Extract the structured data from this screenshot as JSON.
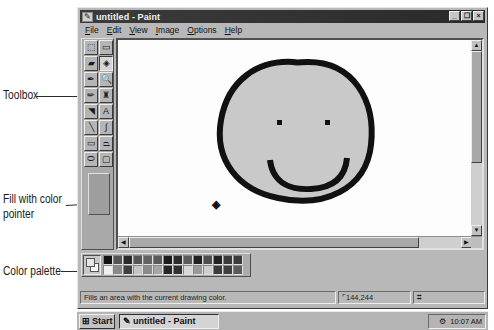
{
  "window": {
    "title": "untitled - Paint",
    "title_icon": "paint-icon",
    "controls": [
      {
        "name": "minimize",
        "glyph": "_"
      },
      {
        "name": "maximize",
        "glyph": "❐"
      },
      {
        "name": "close",
        "glyph": "×"
      }
    ]
  },
  "menu": [
    {
      "key": "F",
      "rest": "ile"
    },
    {
      "key": "E",
      "rest": "dit"
    },
    {
      "key": "V",
      "rest": "iew"
    },
    {
      "key": "I",
      "rest": "mage"
    },
    {
      "key": "O",
      "rest": "ptions"
    },
    {
      "key": "H",
      "rest": "elp"
    }
  ],
  "toolbox": {
    "tools": [
      {
        "name": "free-form-select",
        "glyph": "⬚"
      },
      {
        "name": "select",
        "glyph": "▭"
      },
      {
        "name": "eraser",
        "glyph": "▰"
      },
      {
        "name": "fill-with-color",
        "glyph": "◈",
        "active": true
      },
      {
        "name": "pick-color",
        "glyph": "✒"
      },
      {
        "name": "magnifier",
        "glyph": "🔍"
      },
      {
        "name": "pencil",
        "glyph": "✏"
      },
      {
        "name": "brush",
        "glyph": "♜"
      },
      {
        "name": "airbrush",
        "glyph": "◥"
      },
      {
        "name": "text",
        "glyph": "A"
      },
      {
        "name": "line",
        "glyph": "╲"
      },
      {
        "name": "curve",
        "glyph": "∫"
      },
      {
        "name": "rectangle",
        "glyph": "▭"
      },
      {
        "name": "polygon",
        "glyph": "⏢"
      },
      {
        "name": "ellipse",
        "glyph": "⬭"
      },
      {
        "name": "rounded-rectangle",
        "glyph": "▢"
      }
    ]
  },
  "canvas": {
    "drawing": "smiley-face",
    "face_fill": "#c9c9c9",
    "outline_color": "#111111",
    "fill_cursor": "◈"
  },
  "palette": {
    "foreground": "#e6e6e6",
    "background": "#f8f8f8",
    "row1": [
      "#111111",
      "#555555",
      "#2a2a2a",
      "#555555",
      "#626262",
      "#5a5a5a",
      "#1c1c1c",
      "#2c2c2c",
      "#5a5a5a",
      "#202020",
      "#4e4e4e",
      "#232323",
      "#3a3a3a",
      "#3c3c3c"
    ],
    "row2": [
      "#f0f0f0",
      "#8a8a8a",
      "#404040",
      "#c4c4c4",
      "#8a8a8a",
      "#a6a6a6",
      "#262626",
      "#303030",
      "#d8d8d8",
      "#9a9a9a",
      "#cfcfcf",
      "#3c3c3c",
      "#3e3e3e",
      "#5a5a5a"
    ]
  },
  "status": {
    "help_text": "Fills an area with the current drawing color.",
    "coordinates": "144,244",
    "size": ""
  },
  "taskbar": {
    "start_label": "Start",
    "task_label": "untitled - Paint",
    "clock": "10:07 AM"
  },
  "callouts": {
    "toolbox": "Toolbox",
    "fill_line1": "Fill with color",
    "fill_line2": "pointer",
    "palette": "Color palette"
  }
}
